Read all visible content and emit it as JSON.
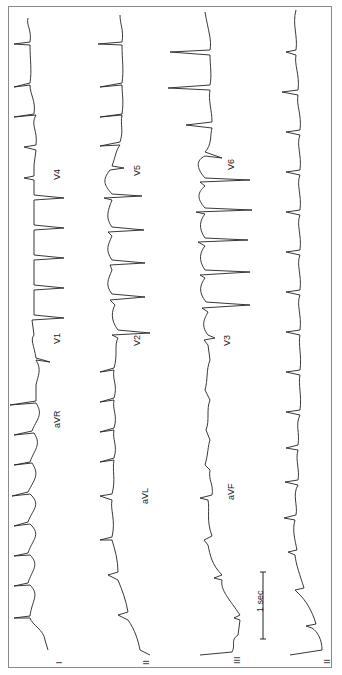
{
  "figure": {
    "type": "12-lead ECG tracing (rotated 90° counter-clockwise)",
    "orientation": "rotated",
    "scale_bar": {
      "label": "1 sec"
    },
    "rows": [
      {
        "name": "row-1",
        "leads": [
          "I",
          "aVR",
          "V1",
          "V4"
        ]
      },
      {
        "name": "row-2",
        "leads": [
          "II",
          "aVL",
          "V2",
          "V5"
        ]
      },
      {
        "name": "row-3",
        "leads": [
          "III",
          "aVF",
          "V3",
          "V6"
        ]
      },
      {
        "name": "rhythm-strip",
        "leads": [
          "II"
        ]
      }
    ],
    "labels": {
      "I": "I",
      "II": "II",
      "III": "III",
      "II_rhythm": "II",
      "aVR": "aVR",
      "aVL": "aVL",
      "aVF": "aVF",
      "V1": "V1",
      "V2": "V2",
      "V3": "V3",
      "V4": "V4",
      "V5": "V5",
      "V6": "V6"
    }
  }
}
